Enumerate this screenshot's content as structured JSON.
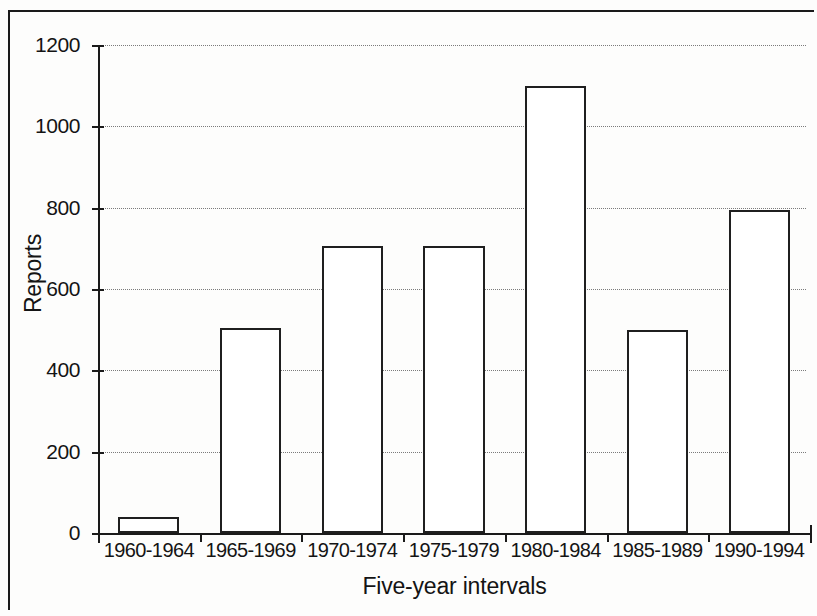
{
  "figure": {
    "background_color": "#fdfdfc",
    "ink_color": "#1a1a1a",
    "grid_color": "#7b7b7b"
  },
  "chart_data": {
    "type": "bar",
    "title": "",
    "subtitle": "",
    "xlabel": "Five-year intervals",
    "ylabel": "Reports",
    "categories": [
      "1960-1964",
      "1965-1969",
      "1970-1974",
      "1975-1979",
      "1980-1984",
      "1985-1989",
      "1990-1994"
    ],
    "values": [
      40,
      505,
      705,
      705,
      1100,
      500,
      795
    ],
    "ylim": [
      0,
      1200
    ],
    "yticks": [
      0,
      200,
      400,
      600,
      800,
      1000,
      1200
    ],
    "ytick_labels": [
      "0",
      "200",
      "400",
      "600",
      "800",
      "1000",
      "1200"
    ],
    "grid": "horizontal-dotted",
    "legend": "none",
    "bar_fill": "#ffffff",
    "bar_edge": "#1f1f1f",
    "annotations": []
  }
}
